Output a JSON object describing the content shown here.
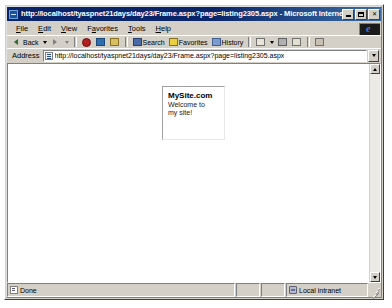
{
  "window": {
    "title": "http://localhost/tyaspnet21days/day23/Frame.aspx?page=listing2305.aspx - Microsoft Internet Explorer",
    "title_icon": "ie-document-icon",
    "buttons": {
      "minimize": "minimize-button",
      "maximize": "maximize-button",
      "close": "✕"
    }
  },
  "menu": {
    "items": [
      {
        "label": "File",
        "accel": "F"
      },
      {
        "label": "Edit",
        "accel": "E"
      },
      {
        "label": "View",
        "accel": "V"
      },
      {
        "label": "Favorites",
        "accel": "a"
      },
      {
        "label": "Tools",
        "accel": "T"
      },
      {
        "label": "Help",
        "accel": "H"
      }
    ],
    "logo": "internet-explorer-logo"
  },
  "toolbar": {
    "buttons": [
      {
        "label": "Back",
        "icon": "back-arrow-icon",
        "enabled": true,
        "has_dropdown": true
      },
      {
        "label": "",
        "icon": "forward-arrow-icon",
        "enabled": false,
        "has_dropdown": true
      },
      {
        "label": "",
        "icon": "stop-icon",
        "enabled": true,
        "has_dropdown": false
      },
      {
        "label": "",
        "icon": "refresh-icon",
        "enabled": true,
        "has_dropdown": false
      },
      {
        "label": "",
        "icon": "home-icon",
        "enabled": true,
        "has_dropdown": false
      },
      {
        "label": "Search",
        "icon": "search-icon",
        "enabled": true,
        "has_dropdown": false
      },
      {
        "label": "Favorites",
        "icon": "favorites-star-icon",
        "enabled": true,
        "has_dropdown": false
      },
      {
        "label": "History",
        "icon": "history-icon",
        "enabled": true,
        "has_dropdown": false
      },
      {
        "label": "",
        "icon": "mail-icon",
        "enabled": true,
        "has_dropdown": true
      },
      {
        "label": "",
        "icon": "print-icon",
        "enabled": true,
        "has_dropdown": false
      },
      {
        "label": "",
        "icon": "edit-icon",
        "enabled": true,
        "has_dropdown": false
      },
      {
        "label": "",
        "icon": "discuss-icon",
        "enabled": true,
        "has_dropdown": false
      }
    ]
  },
  "address": {
    "label": "Address",
    "value": "http://localhost/tyaspnet21days/day23/Frame.aspx?page=listing2305.aspx",
    "placeholder": "",
    "icon": "page-icon",
    "dropdown": "address-dropdown"
  },
  "page": {
    "frame": {
      "heading": "MySite.com",
      "body": "Welcome to my site!"
    },
    "scrollbar": {
      "up": "scroll-up-arrow",
      "down": "scroll-down-arrow"
    }
  },
  "status": {
    "message": "Done",
    "message_icon": "done-document-icon",
    "zone": "Local intranet",
    "zone_icon": "local-intranet-icon"
  },
  "colors": {
    "title_active": "#0a246a",
    "chrome": "#d4d0c8",
    "page_bg": "#ffffff"
  }
}
